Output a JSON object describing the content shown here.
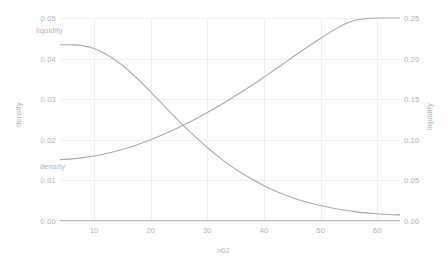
{
  "chart_data": {
    "type": "line",
    "title": "",
    "subtitle": "",
    "xlabel": "n02",
    "ylabel": "density",
    "ylabel_right": "liquidity",
    "xlim": [
      4,
      64
    ],
    "ylim": [
      0.0,
      0.05
    ],
    "ylim_right": [
      0.0,
      0.25
    ],
    "grid": true,
    "legend": "inline-annotations",
    "xticks": [
      10,
      20,
      30,
      40,
      50,
      60
    ],
    "xtick_labels": [
      "10",
      "20",
      "30",
      "40",
      "50",
      "60"
    ],
    "yticks_left": [
      0.0,
      0.01,
      0.02,
      0.03,
      0.04,
      0.05
    ],
    "ytick_labels_left": [
      "0.00",
      "0.01",
      "0.02",
      "0.03",
      "0.04",
      "0.05"
    ],
    "yticks_right": [
      0.0,
      0.05,
      0.1,
      0.15,
      0.2,
      0.25
    ],
    "ytick_labels_right": [
      "0.00",
      "0.05",
      "0.10",
      "0.15",
      "0.20",
      "0.25"
    ],
    "line_color": "#b0aaa4",
    "grid_color": "#f0f0f0",
    "axis_color": "#b9b9b9",
    "tick_text_color": "#b3b3b3",
    "annotations": [
      {
        "text": "liquidity",
        "series": "liquidity"
      },
      {
        "text": "density",
        "series": "density"
      }
    ],
    "x": [
      4,
      6,
      8,
      10,
      12,
      14,
      16,
      18,
      20,
      22,
      24,
      26,
      28,
      30,
      32,
      34,
      36,
      38,
      40,
      42,
      44,
      46,
      48,
      50,
      52,
      54,
      56,
      58,
      60,
      62,
      64
    ],
    "series": [
      {
        "name": "density",
        "axis": "left",
        "values": [
          0.0434,
          0.0434,
          0.0432,
          0.0425,
          0.0412,
          0.0394,
          0.0372,
          0.0346,
          0.0318,
          0.0289,
          0.026,
          0.0232,
          0.0206,
          0.0181,
          0.0158,
          0.0137,
          0.0118,
          0.0102,
          0.0087,
          0.0074,
          0.0063,
          0.0053,
          0.0045,
          0.0038,
          0.0032,
          0.0027,
          0.0023,
          0.002,
          0.0018,
          0.0016,
          0.0015
        ]
      },
      {
        "name": "liquidity",
        "axis": "right",
        "values": [
          0.0755,
          0.0765,
          0.078,
          0.08,
          0.0828,
          0.0862,
          0.0902,
          0.0948,
          0.1,
          0.1058,
          0.112,
          0.1188,
          0.126,
          0.1336,
          0.1416,
          0.15,
          0.1588,
          0.1678,
          0.1772,
          0.1868,
          0.1966,
          0.2063,
          0.2158,
          0.225,
          0.2338,
          0.2418,
          0.247,
          0.2492,
          0.25,
          0.25,
          0.25
        ]
      }
    ]
  }
}
